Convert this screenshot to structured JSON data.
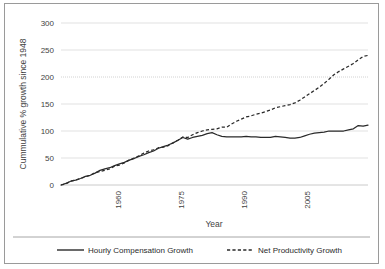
{
  "chart_data": {
    "type": "line",
    "title": "",
    "xlabel": "Year",
    "ylabel": "Cummulative % growth since 1948",
    "xlim": [
      1948,
      2011
    ],
    "ylim": [
      0,
      300
    ],
    "xticks": [
      1960,
      1975,
      1990,
      2005
    ],
    "xticklabels": [
      "1960",
      "1975",
      "1990",
      "2005"
    ],
    "yticks": [
      0,
      50,
      100,
      150,
      200,
      250,
      300
    ],
    "yticklabels": [
      "0",
      "50",
      "100",
      "150",
      "200",
      "250",
      "300"
    ],
    "grid": "horizontal",
    "legend_position": "bottom",
    "x": [
      1948,
      1949,
      1950,
      1951,
      1952,
      1953,
      1954,
      1955,
      1956,
      1957,
      1958,
      1959,
      1960,
      1961,
      1962,
      1963,
      1964,
      1965,
      1966,
      1967,
      1968,
      1969,
      1970,
      1971,
      1972,
      1973,
      1974,
      1975,
      1976,
      1977,
      1978,
      1979,
      1980,
      1981,
      1982,
      1983,
      1984,
      1985,
      1986,
      1987,
      1988,
      1989,
      1990,
      1991,
      1992,
      1993,
      1994,
      1995,
      1996,
      1997,
      1998,
      1999,
      2000,
      2001,
      2002,
      2003,
      2004,
      2005,
      2006,
      2007,
      2008,
      2009,
      2010,
      2011
    ],
    "series": [
      {
        "name": "Hourly Compensation Growth",
        "style": "solid",
        "values": [
          0,
          3,
          7,
          9,
          12,
          16,
          18,
          22,
          27,
          30,
          32,
          36,
          39,
          42,
          46,
          49,
          53,
          56,
          60,
          63,
          68,
          71,
          74,
          78,
          83,
          88,
          85,
          88,
          90,
          92,
          95,
          97,
          93,
          90,
          89,
          89,
          89,
          89,
          90,
          89,
          89,
          88,
          88,
          88,
          90,
          89,
          88,
          87,
          87,
          88,
          91,
          94,
          96,
          97,
          98,
          100,
          100,
          100,
          100,
          102,
          104,
          110,
          109,
          111
        ]
      },
      {
        "name": "Net Productivity Growth",
        "style": "dashed",
        "values": [
          0,
          2,
          7,
          9,
          12,
          15,
          18,
          23,
          25,
          27,
          30,
          35,
          37,
          41,
          46,
          50,
          54,
          59,
          63,
          65,
          69,
          70,
          73,
          78,
          83,
          89,
          88,
          93,
          97,
          100,
          102,
          103,
          104,
          107,
          107,
          113,
          118,
          122,
          126,
          128,
          131,
          133,
          136,
          139,
          143,
          145,
          147,
          149,
          152,
          157,
          163,
          169,
          175,
          181,
          188,
          196,
          204,
          210,
          215,
          220,
          225,
          232,
          238,
          240
        ]
      }
    ]
  },
  "legend": {
    "items": [
      {
        "label": "Hourly Compensation Growth",
        "marker": "solid-line"
      },
      {
        "label": "Net Productivity Growth",
        "marker": "dashed-line"
      }
    ]
  },
  "axes": {
    "y_title": "Cummulative % growth since 1948",
    "x_title": "Year"
  }
}
